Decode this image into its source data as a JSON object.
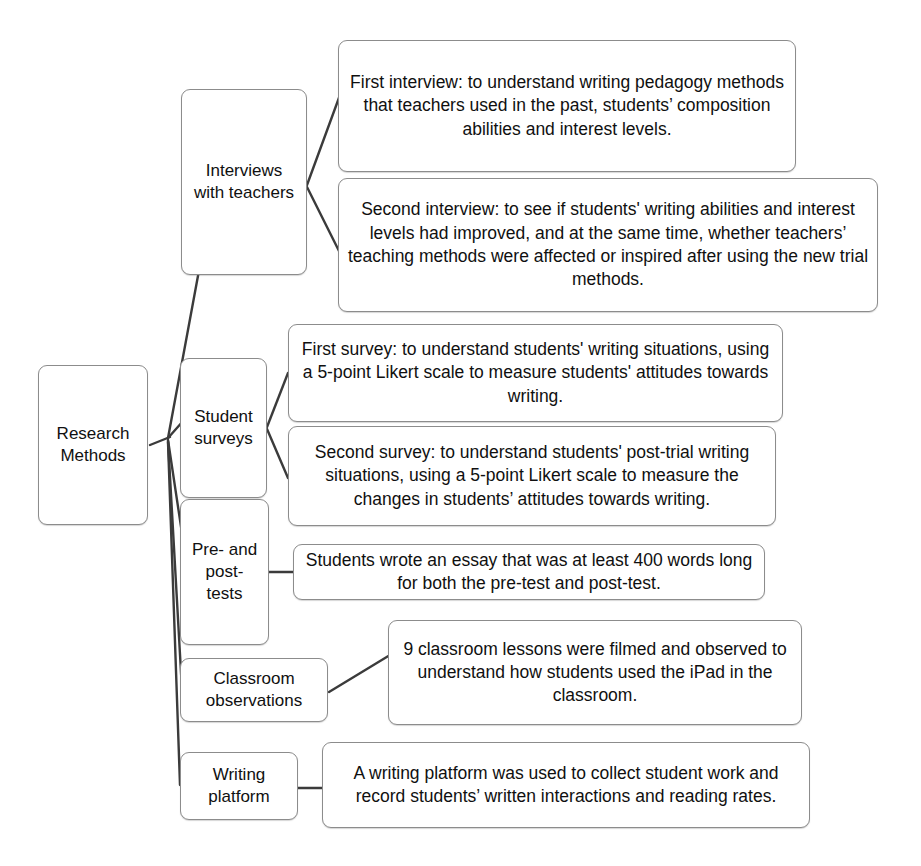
{
  "diagram": {
    "title": "Research Methods",
    "type": "hierarchical-tree-diagram",
    "root": {
      "id": "research-methods",
      "label": "Research\nMethods"
    },
    "branches": [
      {
        "id": "interviews-with-teachers",
        "label": "Interviews\nwith teachers",
        "details": [
          {
            "id": "first-interview",
            "label": "First interview:  to understand writing pedagogy methods that teachers used in the past, students’ composition abilities and interest levels."
          },
          {
            "id": "second-interview",
            "label": "Second interview: to see if students' writing abilities and interest levels had improved, and at the same time, whether teachers’ teaching methods were affected or inspired after using the new trial methods."
          }
        ]
      },
      {
        "id": "student-surveys",
        "label": "Student\nsurveys",
        "details": [
          {
            "id": "first-survey",
            "label": "First survey: to understand students' writing situations, using a 5-point Likert scale to measure students' attitudes towards writing."
          },
          {
            "id": "second-survey",
            "label": "Second survey: to understand students' post-trial writing situations, using a 5-point Likert scale to measure the changes in students’ attitudes towards writing."
          }
        ]
      },
      {
        "id": "pre-and-post-tests",
        "label": "Pre- and\npost-\ntests",
        "details": [
          {
            "id": "pre-post-test-description",
            "label": "Students wrote an essay that was at least 400 words long for both the pre-test and post-test."
          }
        ]
      },
      {
        "id": "classroom-observations",
        "label": "Classroom\nobservations",
        "details": [
          {
            "id": "classroom-observations-description",
            "label": "9 classroom lessons were filmed and observed to understand how students used the iPad in the classroom."
          }
        ]
      },
      {
        "id": "writing-platform",
        "label": "Writing\nplatform",
        "details": [
          {
            "id": "writing-platform-description",
            "label": "A writing platform was used to collect student work and record students’ written interactions and reading rates."
          }
        ]
      }
    ],
    "colors": {
      "box_border": "#8c8c8c",
      "connector": "#3b3b3b",
      "text": "#101010",
      "background": "#ffffff"
    }
  }
}
